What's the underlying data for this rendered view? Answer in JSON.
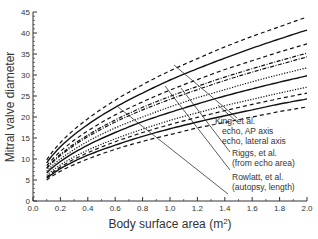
{
  "chart_data": {
    "type": "line",
    "title": "",
    "xlabel": "Body surface area (m²)",
    "ylabel": "Mitral valve diameter",
    "xlim": [
      0.0,
      2.0
    ],
    "ylim": [
      0,
      45
    ],
    "x_ticks": [
      "0.0",
      "0.2",
      "0.4",
      "0.6",
      "0.8",
      "1.0",
      "1.2",
      "1.4",
      "1.6",
      "1.8",
      "2.0"
    ],
    "y_ticks": [
      "0",
      "5",
      "10",
      "15",
      "20",
      "25",
      "30",
      "35",
      "40",
      "45"
    ],
    "grid": false,
    "legend_position": "inline annotations",
    "x": [
      0.1,
      0.2,
      0.4,
      0.6,
      0.8,
      1.0,
      1.2,
      1.4,
      1.6,
      1.8,
      2.0
    ],
    "series": [
      {
        "name": "King et al. echo AP axis upper limit",
        "style": "dashed",
        "values": [
          9.8,
          13.9,
          19.6,
          24.0,
          27.7,
          31.0,
          33.9,
          36.7,
          39.2,
          41.5,
          43.8
        ]
      },
      {
        "name": "Upper mean curve (solid)",
        "style": "solid",
        "values": [
          9.1,
          12.9,
          18.2,
          22.3,
          25.7,
          28.8,
          31.5,
          34.0,
          36.4,
          38.6,
          40.7
        ]
      },
      {
        "name": "King et al. echo lateral axis upper limit",
        "style": "dashed",
        "values": [
          8.4,
          11.8,
          16.7,
          20.5,
          23.6,
          26.4,
          28.9,
          31.3,
          33.4,
          35.5,
          37.4
        ]
      },
      {
        "name": "King et al. echo AP axis",
        "style": "dash-dot",
        "values": [
          7.9,
          11.1,
          15.7,
          19.3,
          22.3,
          24.9,
          27.3,
          29.5,
          31.5,
          33.4,
          35.2
        ]
      },
      {
        "name": "King et al. echo lateral axis",
        "style": "dash-dot",
        "values": [
          7.7,
          10.8,
          15.3,
          18.8,
          21.7,
          24.2,
          26.5,
          28.7,
          30.7,
          32.5,
          34.3
        ]
      },
      {
        "name": "Riggs et al. (from echo area) upper",
        "style": "dotted",
        "values": [
          7.1,
          10.0,
          14.2,
          17.4,
          20.0,
          22.4,
          24.6,
          26.5,
          28.4,
          30.1,
          31.7
        ]
      },
      {
        "name": "Riggs et al. (from echo area)",
        "style": "solid",
        "values": [
          6.7,
          9.4,
          13.3,
          16.3,
          18.9,
          21.1,
          23.1,
          25.0,
          26.7,
          28.3,
          29.8
        ]
      },
      {
        "name": "Riggs et al. lower",
        "style": "dotted",
        "values": [
          6.1,
          8.6,
          12.1,
          14.8,
          17.1,
          19.2,
          21.0,
          22.7,
          24.2,
          25.7,
          27.1
        ]
      },
      {
        "name": "Rowlatt et al. upper",
        "style": "dashed",
        "values": [
          5.7,
          8.1,
          11.5,
          14.1,
          16.3,
          18.2,
          19.9,
          21.5,
          23.0,
          24.4,
          25.7
        ]
      },
      {
        "name": "Rowlatt et al. (autopsy, length)",
        "style": "solid",
        "values": [
          5.4,
          7.7,
          10.9,
          13.3,
          15.4,
          17.2,
          18.8,
          20.3,
          21.7,
          23.1,
          24.3
        ]
      },
      {
        "name": "Lower limit",
        "style": "dashed",
        "values": [
          5.0,
          7.1,
          10.0,
          12.3,
          14.2,
          15.8,
          17.4,
          18.7,
          20.0,
          21.3,
          22.4
        ]
      }
    ],
    "annotations": [
      {
        "lines": [
          "King, et al.",
          "echo, AP axis",
          "echo, lateral axis"
        ]
      },
      {
        "lines": [
          "Riggs, et al.",
          "(from echo area)"
        ]
      },
      {
        "lines": [
          "Rowlatt, et al.",
          "(autopsy, length)"
        ]
      }
    ]
  }
}
